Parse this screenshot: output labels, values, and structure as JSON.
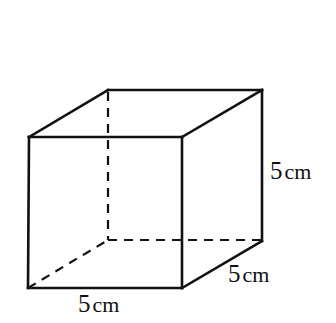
{
  "figure": {
    "kind": "geometry-diagram",
    "shape_name": "cube",
    "canvas": {
      "width": 336,
      "height": 323
    },
    "background_color": "#ffffff",
    "stroke_color": "#111111",
    "solid_stroke_width": 2.6,
    "dashed_stroke_width": 2.2,
    "dash_pattern": "9 7"
  },
  "labels": {
    "height": {
      "number": "5",
      "unit": "cm"
    },
    "depth": {
      "number": "5",
      "unit": "cm"
    },
    "width": {
      "number": "5",
      "unit": "cm"
    }
  },
  "geometry": {
    "front_face": {
      "top_left": [
        29,
        137
      ],
      "top_right": [
        182,
        137
      ],
      "bottom_right": [
        182,
        288
      ],
      "bottom_left": [
        28,
        288
      ]
    },
    "back_face": {
      "top_left": [
        108,
        90
      ],
      "top_right": [
        262,
        90
      ],
      "bottom_right": [
        262,
        241
      ],
      "bottom_left": [
        108,
        240
      ]
    },
    "solid_edges": [
      [
        [
          29,
          137
        ],
        [
          182,
          137
        ]
      ],
      [
        [
          182,
          137
        ],
        [
          182,
          288
        ]
      ],
      [
        [
          182,
          288
        ],
        [
          28,
          288
        ]
      ],
      [
        [
          28,
          288
        ],
        [
          29,
          137
        ]
      ],
      [
        [
          108,
          90
        ],
        [
          262,
          90
        ]
      ],
      [
        [
          262,
          90
        ],
        [
          262,
          241
        ]
      ],
      [
        [
          29,
          137
        ],
        [
          108,
          90
        ]
      ],
      [
        [
          182,
          137
        ],
        [
          262,
          90
        ]
      ],
      [
        [
          182,
          288
        ],
        [
          262,
          241
        ]
      ]
    ],
    "hidden_edges": [
      [
        [
          108,
          92
        ],
        [
          108,
          240
        ]
      ],
      [
        [
          108,
          240
        ],
        [
          262,
          240
        ]
      ],
      [
        [
          28,
          288
        ],
        [
          108,
          240
        ]
      ]
    ]
  },
  "chart_data": {
    "type": "diagram",
    "title": "",
    "shape": "cube",
    "edge_length": 5,
    "unit": "cm",
    "dimensions": [
      {
        "name": "width",
        "value": 5,
        "unit": "cm",
        "label": "5 cm"
      },
      {
        "name": "depth",
        "value": 5,
        "unit": "cm",
        "label": "5 cm"
      },
      {
        "name": "height",
        "value": 5,
        "unit": "cm",
        "label": "5 cm"
      }
    ]
  }
}
